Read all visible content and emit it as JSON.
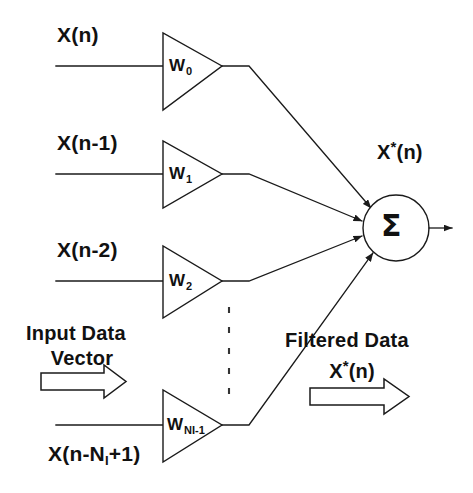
{
  "figure": {
    "background_color": "#ffffff",
    "line_color": "#1a1a1a",
    "text_color": "#111111"
  },
  "taps": [
    {
      "id": "tap-0",
      "input_label": "X(n)",
      "weight_symbol": "W",
      "weight_subscript": "0"
    },
    {
      "id": "tap-1",
      "input_label": "X(n-1)",
      "weight_symbol": "W",
      "weight_subscript": "1"
    },
    {
      "id": "tap-2",
      "input_label": "X(n-2)",
      "weight_symbol": "W",
      "weight_subscript": "2"
    },
    {
      "id": "tap-last",
      "input_label_prefix": "X(n-N",
      "input_label_subscript": "I",
      "input_label_suffix": "+1)",
      "weight_symbol": "W",
      "weight_subscript": "NI-1"
    }
  ],
  "summation": {
    "symbol": "Σ",
    "output_label_prefix": "X",
    "output_label_star": "*",
    "output_label_suffix": "(n)"
  },
  "annotations": {
    "input_vector_line1": "Input Data",
    "input_vector_line2": "Vector",
    "filtered_line1": "Filtered Data",
    "filtered_signal_prefix": "X",
    "filtered_signal_star": "*",
    "filtered_signal_suffix": "(n)"
  },
  "ellipsis": {
    "dots": 5
  }
}
